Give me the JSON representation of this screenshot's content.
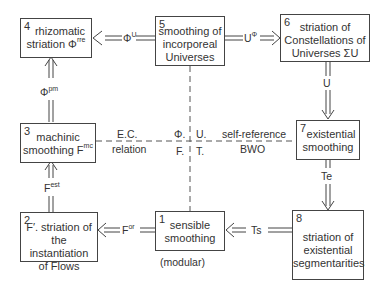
{
  "nodes": [
    {
      "id": "1",
      "num": "1",
      "line1": "sensible",
      "line2": "smoothing",
      "caption": "(modular)"
    },
    {
      "id": "2",
      "num": "2",
      "line1": "F′. striation of",
      "line2": "the instantiation",
      "line3": "of Flows"
    },
    {
      "id": "3",
      "num": "3",
      "line1": "machinic",
      "line2": "smoothing F",
      "sup": "mc"
    },
    {
      "id": "4",
      "num": "4",
      "line1": "rhizomatic",
      "line2": "striation Φ",
      "sup": "rre"
    },
    {
      "id": "5",
      "num": "5",
      "line1": "smoothing of",
      "line2": "incorporeal",
      "line3": "Universes"
    },
    {
      "id": "6",
      "num": "6",
      "line1": "striation of",
      "line2": "Constellations of",
      "line3": "Universes ΣU"
    },
    {
      "id": "7",
      "num": "7",
      "line1": "existential",
      "line2": "smoothing"
    },
    {
      "id": "8",
      "num": "8",
      "line1": "striation of",
      "line2": "existential",
      "line3": "segmentarities"
    }
  ],
  "edges": {
    "e5_4": {
      "base": "Φ",
      "sup": "U",
      "sub": "."
    },
    "e5_6": {
      "base": "U",
      "sup": "Φ",
      "sub": "."
    },
    "e3_4": {
      "base": "Φ",
      "sup": "pm",
      "sub": "."
    },
    "e6_7": {
      "base": "U"
    },
    "e7_8": {
      "base": "Te"
    },
    "e8_1": {
      "base": "Ts"
    },
    "e1_2": {
      "base": "F",
      "sup": "or",
      "sub": "."
    },
    "e2_3": {
      "base": "F",
      "sup": "est",
      "sub": "."
    }
  },
  "relations": {
    "left_top": "E.C.",
    "left_bottom": "relation",
    "right_top": "self-reference",
    "right_bottom": "BWO"
  },
  "quadrants": {
    "phi": "Φ.",
    "u": "U.",
    "f": "F.",
    "t": "T."
  }
}
